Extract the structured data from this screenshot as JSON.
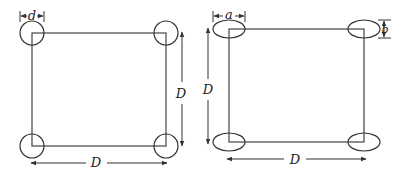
{
  "figures": [
    {
      "name": "circular-columns",
      "corner_shape": "circle",
      "labels": {
        "diameter": "d",
        "side_vertical": "D",
        "side_horizontal": "D"
      }
    },
    {
      "name": "elliptical-columns",
      "corner_shape": "ellipse",
      "labels": {
        "major_axis": "a",
        "minor_axis": "b",
        "side_vertical": "D",
        "side_horizontal": "D"
      }
    }
  ],
  "colors": {
    "stroke": "#333333",
    "background": "#ffffff"
  }
}
